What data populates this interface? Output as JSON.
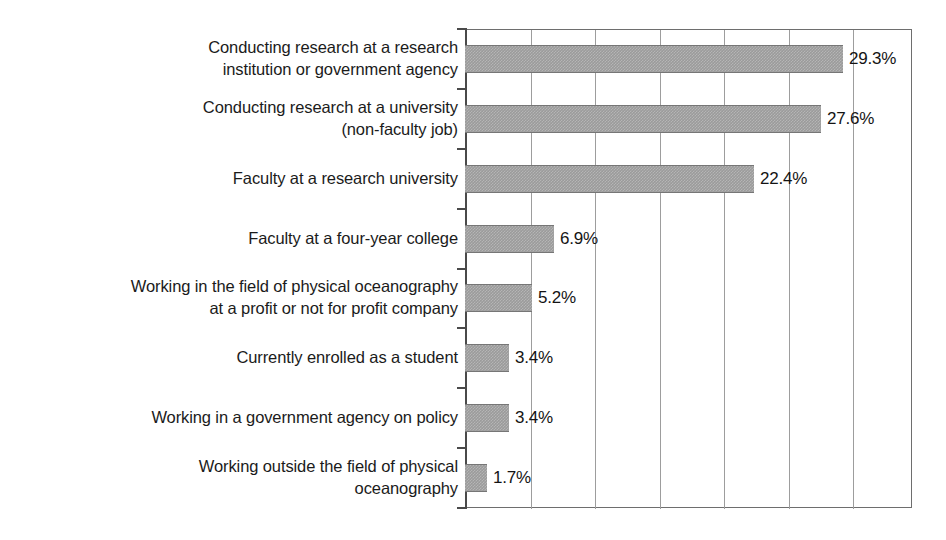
{
  "chart_data": {
    "type": "bar",
    "orientation": "horizontal",
    "title": "",
    "subtitle": "",
    "xlabel": "",
    "ylabel": "",
    "xlim": [
      0,
      34.65
    ],
    "grid": true,
    "gridline_interval": 5,
    "gridline_values": [
      5,
      10,
      15,
      20,
      25,
      30
    ],
    "tick_labels_x": [],
    "legend": null,
    "value_label_suffix": "%",
    "bar_color": "#9b9b9b",
    "categories": [
      "Conducting research at a research\ninstitution or government agency",
      "Conducting research at a university\n(non-faculty job)",
      "Faculty at a research university",
      "Faculty at a four-year college",
      "Working in the field of physical oceanography\nat a profit or not for profit company",
      "Currently enrolled as a student",
      "Working in a government agency on policy",
      "Working outside the field of physical\noceanography"
    ],
    "values": [
      29.3,
      27.6,
      22.4,
      6.9,
      5.2,
      3.4,
      3.4,
      1.7
    ],
    "value_labels": [
      "29.3%",
      "27.6%",
      "22.4%",
      "6.9%",
      "5.2%",
      "3.4%",
      "3.4%",
      "1.7%"
    ]
  }
}
